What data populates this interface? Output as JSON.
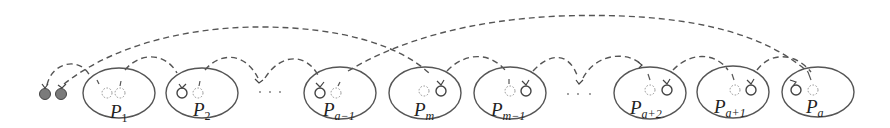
{
  "diagram": {
    "type": "partition-chain",
    "description_visible": "Sequence of partitions with dashed arcs connecting them",
    "ellipsis_symbol": "· · ·",
    "start_nodes": {
      "count": 2,
      "style": "filled-grey"
    },
    "partitions": [
      {
        "id": "P1",
        "base": "P",
        "sub": "1",
        "cx": 119,
        "left_node": "dashed",
        "right_node": "dashed"
      },
      {
        "id": "P2",
        "base": "P",
        "sub": "2",
        "cx": 202,
        "left_node": "solid",
        "right_node": "dashed"
      },
      {
        "id": "Pa-1",
        "base": "P",
        "sub": "a−1",
        "cx": 340,
        "left_node": "solid",
        "right_node": "dashed"
      },
      {
        "id": "Pm",
        "base": "P",
        "sub": "m",
        "cx": 425,
        "left_node": "dashed",
        "right_node": "solid"
      },
      {
        "id": "Pm-1",
        "base": "P",
        "sub": "m−1",
        "cx": 510,
        "left_node": "dashed",
        "right_node": "solid"
      },
      {
        "id": "Pa+2",
        "base": "P",
        "sub": "a+2",
        "cx": 650,
        "left_node": "dashed",
        "right_node": "solid"
      },
      {
        "id": "Pa+1",
        "base": "P",
        "sub": "a+1",
        "cx": 733,
        "left_node": "dashed",
        "right_node": "solid"
      },
      {
        "id": "Pa",
        "base": "P",
        "sub": "a",
        "cx": 816,
        "left_node": "solid",
        "right_node": "dashed"
      }
    ],
    "labels": {
      "p1": "P",
      "p1_sub": "1",
      "p2": "P",
      "p2_sub": "2",
      "pa_minus_1": "P",
      "pa_minus_1_sub": "a−1",
      "pm": "P",
      "pm_sub": "m",
      "pm_minus_1": "P",
      "pm_minus_1_sub": "m−1",
      "pa_plus_2": "P",
      "pa_plus_2_sub": "a+2",
      "pa_plus_1": "P",
      "pa_plus_1_sub": "a+1",
      "pa": "P",
      "pa_sub": "a"
    },
    "colors": {
      "stroke": "#555555",
      "filled_node": "#7a7a7a",
      "background": "#ffffff"
    }
  }
}
